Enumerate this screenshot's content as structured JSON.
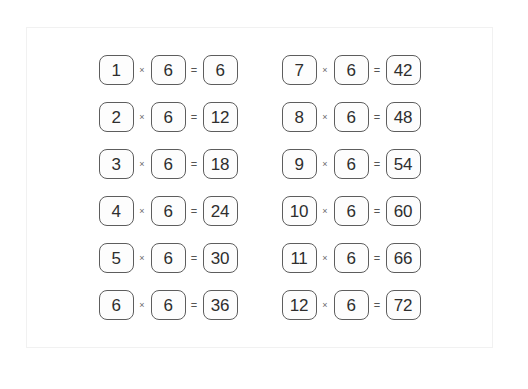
{
  "worksheet": {
    "title": "Multiplication facts for 6",
    "operators": {
      "multiply": "×",
      "equals": "="
    },
    "columns": [
      {
        "name": "left-column",
        "rows": [
          {
            "multiplicand": "1",
            "multiplier": "6",
            "product": "6"
          },
          {
            "multiplicand": "2",
            "multiplier": "6",
            "product": "12"
          },
          {
            "multiplicand": "3",
            "multiplier": "6",
            "product": "18"
          },
          {
            "multiplicand": "4",
            "multiplier": "6",
            "product": "24"
          },
          {
            "multiplicand": "5",
            "multiplier": "6",
            "product": "30"
          },
          {
            "multiplicand": "6",
            "multiplier": "6",
            "product": "36"
          }
        ]
      },
      {
        "name": "right-column",
        "rows": [
          {
            "multiplicand": "7",
            "multiplier": "6",
            "product": "42"
          },
          {
            "multiplicand": "8",
            "multiplier": "6",
            "product": "48"
          },
          {
            "multiplicand": "9",
            "multiplier": "6",
            "product": "54"
          },
          {
            "multiplicand": "10",
            "multiplier": "6",
            "product": "60"
          },
          {
            "multiplicand": "11",
            "multiplier": "6",
            "product": "66"
          },
          {
            "multiplicand": "12",
            "multiplier": "6",
            "product": "72"
          }
        ]
      }
    ]
  },
  "colors": {
    "box_border": "#5d5d5d",
    "digit": "#2e2e2e",
    "operator": "#6a6a6a",
    "card_border": "#f1f1f1",
    "page_background": "#ffffff"
  }
}
